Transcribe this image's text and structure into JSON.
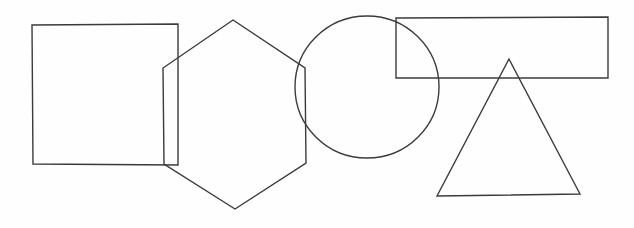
{
  "canvas": {
    "width": 634,
    "height": 228,
    "background_color": "#fefefe",
    "stroke_color": "#3b3b3b",
    "stroke_width": 1.4,
    "fill": "none",
    "title": "Overlapping geometric shape outlines"
  },
  "chart_data": {
    "type": "diagram",
    "title": "Overlapping geometric shape outlines",
    "shape_count": 5,
    "shapes": [
      {
        "id": "square",
        "name": "square",
        "sides": 4,
        "order": 1,
        "bbox": {
          "x": 32,
          "y": 25,
          "width": 146,
          "height": 140
        },
        "points": "32,25 178,24 178,165 33,164",
        "overlaps": [
          "hexagon"
        ]
      },
      {
        "id": "hexagon",
        "name": "hexagon",
        "sides": 6,
        "order": 2,
        "bbox": {
          "x": 163,
          "y": 20,
          "width": 143,
          "height": 189
        },
        "points": "233,20 305,68 306,163 235,209 164,164 163,68",
        "overlaps": [
          "square",
          "circle"
        ]
      },
      {
        "id": "circle",
        "name": "circle",
        "sides": 0,
        "order": 3,
        "bbox": {
          "x": 295,
          "y": 15,
          "width": 145,
          "height": 143
        },
        "center": {
          "cx": 367,
          "cy": 87
        },
        "radius": {
          "rx": 72,
          "ry": 71
        },
        "overlaps": [
          "hexagon",
          "rectangle"
        ]
      },
      {
        "id": "rectangle",
        "name": "rectangle",
        "sides": 4,
        "order": 4,
        "bbox": {
          "x": 396,
          "y": 18,
          "width": 212,
          "height": 60
        },
        "points": "396,18 608,17 608,78 396,78",
        "overlaps": [
          "circle",
          "triangle"
        ]
      },
      {
        "id": "triangle",
        "name": "triangle",
        "sides": 3,
        "order": 5,
        "bbox": {
          "x": 437,
          "y": 59,
          "width": 143,
          "height": 137
        },
        "points": "509,59 580,194 437,196",
        "overlaps": [
          "rectangle"
        ]
      }
    ]
  }
}
